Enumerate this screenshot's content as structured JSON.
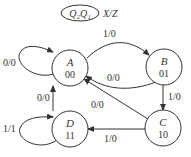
{
  "legend": {
    "state_vars": "Q₂Q₁",
    "io_format": "X/Z"
  },
  "states": [
    {
      "id": "A",
      "name": "A",
      "code": "00"
    },
    {
      "id": "B",
      "name": "B",
      "code": "01"
    },
    {
      "id": "C",
      "name": "C",
      "code": "10"
    },
    {
      "id": "D",
      "name": "D",
      "code": "11"
    }
  ],
  "transitions": [
    {
      "from": "A",
      "to": "A",
      "label": "0/0"
    },
    {
      "from": "A",
      "to": "B",
      "label": "1/0"
    },
    {
      "from": "B",
      "to": "A",
      "label": "0/0"
    },
    {
      "from": "B",
      "to": "C",
      "label": "1/0"
    },
    {
      "from": "C",
      "to": "A",
      "label": "0/0"
    },
    {
      "from": "C",
      "to": "D",
      "label": "1/0"
    },
    {
      "from": "D",
      "to": "A",
      "label": "0/0"
    },
    {
      "from": "D",
      "to": "D",
      "label": "1/1"
    }
  ]
}
